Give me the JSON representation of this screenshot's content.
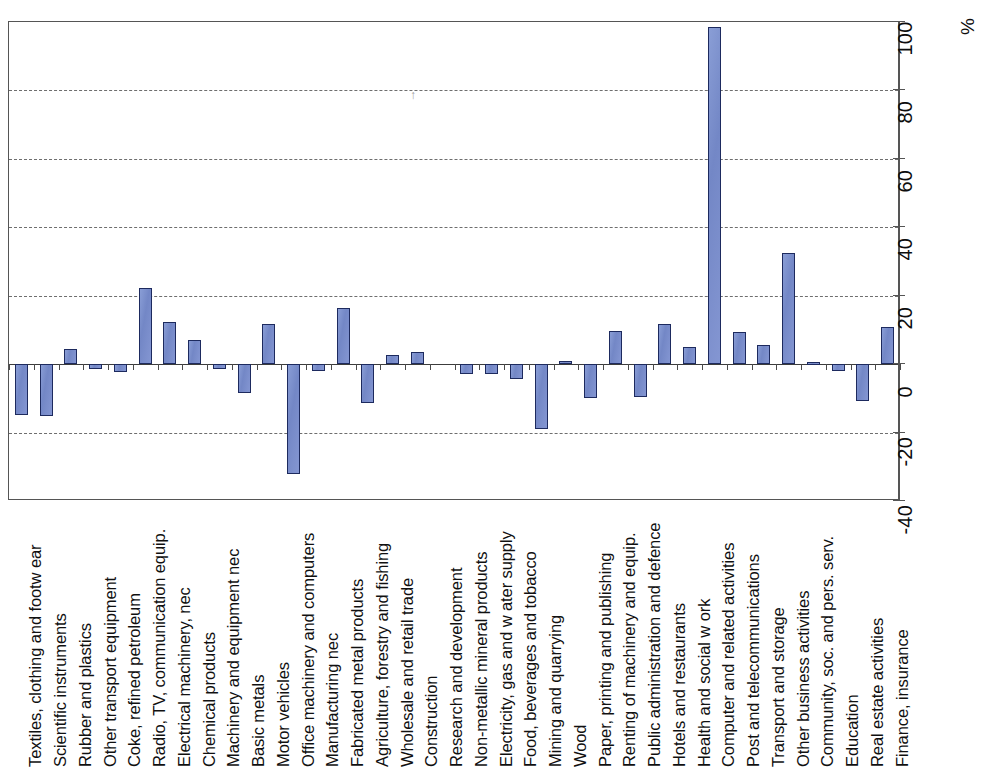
{
  "chart_data": {
    "type": "bar",
    "title": "",
    "subtitle": "",
    "xlabel": "",
    "ylabel": "%",
    "unit_label": "%",
    "orientation": "rotated-90",
    "grid": true,
    "legend": "none",
    "ylim": [
      -40,
      100
    ],
    "ytick_labels": [
      "100",
      "80",
      "60",
      "40",
      "20",
      "0",
      "-20",
      "-40"
    ],
    "yticks": [
      100,
      80,
      60,
      40,
      20,
      0,
      -20,
      -40
    ],
    "bar_color": "#7d91cf",
    "bar_border_color": "#1d2a5e",
    "categories": [
      "Textiles, clothing and footw ear",
      "Scientific instruments",
      "Rubber and plastics",
      "Other transport equipment",
      "Coke, refined petroleum",
      "Radio, TV, communication equip.",
      "Electrical machinery, nec",
      "Chemical products",
      "Machinery and equipment nec",
      "Basic metals",
      "Motor vehicles",
      "Office machinery and computers",
      "Manufacturing nec",
      "Fabricated metal products",
      "Agriculture, forestry and fishing",
      "Wholesale and retail trade",
      "Construction",
      "Research and development",
      "Non-metallic mineral products",
      "Electricity, gas and w ater supply",
      "Food, beverages and tobacco",
      "Mining and quarrying",
      "Wood",
      "Paper, printing and publishing",
      "Renting of machinery and equip.",
      "Public administration and defence",
      "Hotels and restaurants",
      "Health and social w ork",
      "Computer and related activities",
      "Post and telecommunications",
      "Transport and storage",
      "Other business activities",
      "Community, soc. and pers. serv.",
      "Education",
      "Real estate activities",
      "Finance, insurance"
    ],
    "values": [
      -14.8,
      -15.2,
      4.5,
      -1.5,
      -2.2,
      22.3,
      12.2,
      7.2,
      -1.3,
      -8.5,
      11.8,
      -32.0,
      -2.0,
      16.3,
      -11.5,
      2.8,
      3.5,
      0.0,
      -3.0,
      -2.8,
      -4.2,
      -19.0,
      0.8,
      -10.0,
      9.8,
      -9.5,
      11.7,
      5.0,
      98.5,
      9.3,
      5.5,
      32.5,
      0.6,
      -2.0,
      -10.8,
      10.8
    ]
  }
}
